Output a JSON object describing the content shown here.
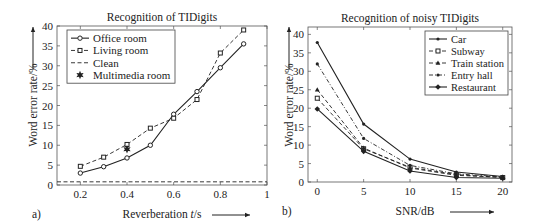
{
  "chart_data": [
    {
      "type": "line",
      "panel_label": "a)",
      "title": "Recognition of TIDigits",
      "xlabel": "Reverberation t/s",
      "ylabel": "Word error rate/%",
      "xlim": [
        0.1,
        1.0
      ],
      "ylim": [
        0,
        40
      ],
      "xticks": [
        "0.2",
        "0.4",
        "0.6",
        "0.8",
        "1"
      ],
      "yticks": [
        "0",
        "5",
        "10",
        "15",
        "20",
        "25",
        "30",
        "35",
        "40"
      ],
      "grid": false,
      "legend_position": "upper left",
      "x": [
        0.2,
        0.3,
        0.4,
        0.5,
        0.6,
        0.7,
        0.8,
        0.9
      ],
      "series": [
        {
          "name": "Office room",
          "style": "solid",
          "marker": "circle",
          "values": [
            3.0,
            4.6,
            6.8,
            10.0,
            17.8,
            23.5,
            29.5,
            35.5
          ]
        },
        {
          "name": "Living room",
          "style": "dashed",
          "marker": "square",
          "values": [
            4.7,
            7.0,
            10.2,
            14.3,
            16.8,
            21.5,
            33.2,
            39.0
          ]
        },
        {
          "name": "Clean",
          "style": "dashed",
          "marker": "none",
          "values": [
            0.8,
            0.8,
            0.8,
            0.8,
            0.8,
            0.8,
            0.8,
            0.8
          ]
        },
        {
          "name": "Multimedia room",
          "style": "none",
          "marker": "star",
          "x": [
            0.4
          ],
          "values": [
            9.0
          ]
        }
      ]
    },
    {
      "type": "line",
      "panel_label": "b)",
      "title": "Recognition of noisy TIDigits",
      "xlabel": "SNR/dB",
      "ylabel": "Word error rate/%",
      "xlim": [
        -1,
        21
      ],
      "ylim": [
        0,
        42
      ],
      "xticks": [
        "0",
        "5",
        "10",
        "15",
        "20"
      ],
      "yticks": [
        "0",
        "5",
        "10",
        "15",
        "20",
        "25",
        "30",
        "35",
        "40"
      ],
      "grid": false,
      "legend_position": "upper right",
      "x": [
        0,
        5,
        10,
        15,
        20
      ],
      "series": [
        {
          "name": "Car",
          "style": "solid",
          "marker": "dot",
          "values": [
            37.8,
            15.7,
            6.2,
            2.7,
            1.5
          ]
        },
        {
          "name": "Subway",
          "style": "dashed",
          "marker": "square",
          "values": [
            22.7,
            9.0,
            4.0,
            2.0,
            1.2
          ]
        },
        {
          "name": "Train station",
          "style": "dashed",
          "marker": "triangle",
          "values": [
            25.0,
            9.2,
            3.8,
            1.8,
            1.3
          ]
        },
        {
          "name": "Entry hall",
          "style": "dashdot",
          "marker": "dot",
          "values": [
            32.0,
            11.8,
            4.5,
            2.2,
            1.4
          ]
        },
        {
          "name": "Restaurant",
          "style": "solid",
          "marker": "diamond",
          "values": [
            19.8,
            8.3,
            3.0,
            1.2,
            1.0
          ]
        }
      ]
    }
  ]
}
